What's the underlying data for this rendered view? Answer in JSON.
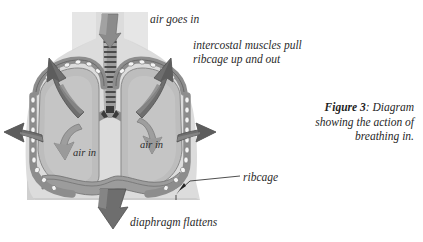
{
  "figure": {
    "caption_label": "Figure 3",
    "caption_separator": ":",
    "caption_text": "Diagram showing the action of breathing in."
  },
  "annotations": {
    "air_goes_in": "air goes in",
    "intercostal_line1": "intercostal muscles pull",
    "intercostal_line2": "ribcage up and out",
    "air_in_left": "air in",
    "air_in_right": "air in",
    "diaphragm_flattens": "diaphragm flattens",
    "ribcage": "ribcage"
  },
  "colors": {
    "body_silhouette": "#dcdcdc",
    "body_silhouette_shadow": "#cfcfcf",
    "lung_fill": "#b9b9b9",
    "lung_fill_light": "#c6c6c6",
    "ribcage_band": "#8e8e8e",
    "rib_bead": "#f2f2f2",
    "arrow_dark": "#6e6e6e",
    "arrow_dark_edge": "#4a4a4a",
    "arrow_inner": "#9a9a9a",
    "trachea": "#9d9d9d",
    "trachea_ring": "#3c3c3c",
    "diaphragm": "#9c9c9c",
    "text": "#2b2b2b",
    "background": "#ffffff"
  },
  "diagram": {
    "type": "anatomical-diagram",
    "parts": [
      "body silhouette",
      "trachea",
      "bronchi",
      "left lung",
      "right lung",
      "ribcage",
      "diaphragm"
    ],
    "motion_arrows": [
      {
        "name": "air-into-trachea",
        "direction": "down"
      },
      {
        "name": "ribcage-up-left",
        "direction": "up-left"
      },
      {
        "name": "ribcage-up-right",
        "direction": "up-right"
      },
      {
        "name": "ribcage-out-left",
        "direction": "left"
      },
      {
        "name": "ribcage-out-right",
        "direction": "right"
      },
      {
        "name": "air-in-left-lung",
        "direction": "down-curved"
      },
      {
        "name": "air-in-right-lung",
        "direction": "down-curved"
      },
      {
        "name": "diaphragm-down",
        "direction": "down"
      }
    ]
  }
}
